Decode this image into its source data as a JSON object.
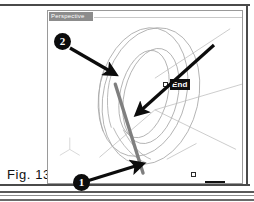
{
  "figure": {
    "caption": "Fig. 13"
  },
  "viewport": {
    "title": "Perspective",
    "background_color": "#ffffff",
    "border_color": "#9a9a9a",
    "title_bar_color": "#8c8c8c"
  },
  "snap_tooltips": [
    {
      "label": "End",
      "position": "upper",
      "x": 122,
      "y": 68
    },
    {
      "label": "End",
      "position": "lower",
      "x": 157,
      "y": 170
    }
  ],
  "snap_markers": [
    {
      "name": "upper-endpoint",
      "x": 115,
      "y": 71
    },
    {
      "name": "lower-endpoint",
      "x": 143,
      "y": 161
    }
  ],
  "callouts": [
    {
      "number": "2",
      "x": 54,
      "y": 33,
      "points_to": "upper-endpoint"
    },
    {
      "number": "1",
      "x": 73,
      "y": 174,
      "points_to": "lower-endpoint"
    }
  ],
  "annotation_arrows": [
    {
      "name": "arrow-to-upper-endpoint",
      "from_x": 70,
      "from_y": 48,
      "to_x": 114,
      "to_y": 73
    },
    {
      "name": "arrow-to-lower-endpoint",
      "from_x": 88,
      "from_y": 180,
      "to_x": 141,
      "to_y": 163
    },
    {
      "name": "arrow-to-drawn-line",
      "from_x": 213,
      "from_y": 46,
      "to_x": 136,
      "to_y": 113
    }
  ],
  "geometry": {
    "drawn_line_color": "#7f7f7f",
    "wireframe_color": "#a8a8a8",
    "description": "torus ring wireframe in perspective with a drawn line between two endpoint snaps"
  },
  "colors": {
    "ink": "#111111",
    "frame": "#4a4a4a",
    "tooltip_bg": "#111111",
    "tooltip_fg": "#ffffff",
    "badge_bg": "#0c0c0c",
    "badge_fg": "#ffffff"
  }
}
